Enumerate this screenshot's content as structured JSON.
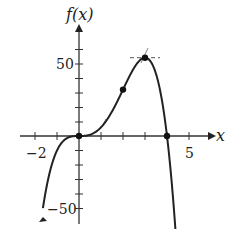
{
  "chart_data": {
    "type": "line",
    "title": "",
    "xlabel": "x",
    "ylabel": "f(x)",
    "xlim": [
      -2,
      5
    ],
    "ylim": [
      -50,
      60
    ],
    "x_tick_step": 1,
    "y_tick_step": 10,
    "x_tick_labels": [
      {
        "value": -2,
        "label": "−2"
      },
      {
        "value": 5,
        "label": "5"
      }
    ],
    "y_tick_labels": [
      {
        "value": 50,
        "label": "50"
      },
      {
        "value": -50,
        "label": "−50"
      }
    ],
    "grid": false,
    "series": [
      {
        "name": "f(x)",
        "formula": "8x^3 - 2x^4",
        "x": [
          -1.64,
          -1.5,
          -1,
          -0.5,
          0,
          0.5,
          1,
          1.5,
          2,
          2.5,
          3,
          3.5,
          4,
          4.4
        ],
        "y": [
          -50.6,
          -37.1,
          -10,
          -1.1,
          0,
          0.9,
          6,
          16.9,
          32,
          46.9,
          54,
          42.9,
          0,
          -68.1
        ]
      }
    ],
    "marked_points": [
      {
        "x": 0,
        "y": 0,
        "note": "root / inflection"
      },
      {
        "x": 2,
        "y": 32,
        "note": "inflection point"
      },
      {
        "x": 3,
        "y": 54,
        "note": "local maximum"
      },
      {
        "x": 4,
        "y": 0,
        "note": "root"
      }
    ],
    "tangent_lines": [
      {
        "at_x": 3,
        "slope": 0,
        "style": "dashed"
      },
      {
        "at_x": 2,
        "slope": 32,
        "style": "dashed"
      }
    ]
  },
  "labels": {
    "x_axis": "x",
    "y_axis": "f(x)",
    "x_min_tick": "−2",
    "x_max_tick": "5",
    "y_pos_tick": "50",
    "y_neg_tick": "−50"
  }
}
